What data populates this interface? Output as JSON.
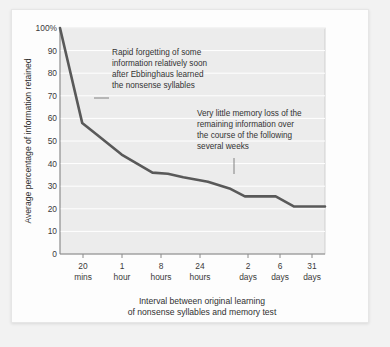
{
  "chart_data": {
    "type": "line",
    "title": "",
    "xlabel": "Interval between original learning of nonsense syllables and memory test",
    "ylabel": "Average percentage of information retained",
    "ylim": [
      0,
      100
    ],
    "grid": true,
    "legend": "none",
    "categories": [
      "20 mins",
      "1 hour",
      "8 hours",
      "24 hours",
      "2 days",
      "6 days",
      "31 days"
    ],
    "x_tick_top": [
      "20",
      "1",
      "8",
      "24",
      "2",
      "6",
      "31"
    ],
    "x_tick_bottom": [
      "mins",
      "hour",
      "hours",
      "hours",
      "days",
      "days",
      "days"
    ],
    "y_ticks": [
      "100%",
      "90",
      "80",
      "70",
      "60",
      "50",
      "40",
      "30",
      "20",
      "10",
      "0"
    ],
    "y_tick_values": [
      100,
      90,
      80,
      70,
      60,
      50,
      40,
      30,
      20,
      10,
      0
    ],
    "series": [
      {
        "name": "Retention",
        "points": [
          {
            "x": 0.0,
            "label": "immediately",
            "y": 100
          },
          {
            "x": 0.72,
            "label": "20 mins",
            "y": 58
          },
          {
            "x": 1.18,
            "label": "",
            "y": 53
          },
          {
            "x": 2.0,
            "label": "1 hour",
            "y": 44
          },
          {
            "x": 3.0,
            "label": "8 hours",
            "y": 36
          },
          {
            "x": 3.5,
            "label": "",
            "y": 35.5
          },
          {
            "x": 4.0,
            "label": "24 hours",
            "y": 34
          },
          {
            "x": 4.8,
            "label": "",
            "y": 32
          },
          {
            "x": 5.5,
            "label": "",
            "y": 29
          },
          {
            "x": 6.0,
            "label": "2 days",
            "y": 25.5
          },
          {
            "x": 6.6,
            "label": "",
            "y": 25.5
          },
          {
            "x": 7.0,
            "label": "6 days",
            "y": 25.5
          },
          {
            "x": 7.6,
            "label": "",
            "y": 21
          },
          {
            "x": 8.6,
            "label": "31 days",
            "y": 21
          }
        ]
      }
    ],
    "annotations": [
      {
        "name": "rapid-forgetting-note",
        "lines": [
          "Rapid forgetting of some",
          "information relatively soon",
          "after Ebbinghaus learned",
          "the nonsense syllables"
        ],
        "leader": "horizontal-left"
      },
      {
        "name": "little-memory-loss-note",
        "lines": [
          "Very little memory loss of the",
          "remaining information over",
          "the course of the following",
          "several weeks"
        ],
        "leader": "vertical-down"
      }
    ],
    "caption_lines": [
      "Interval between original learning",
      "of nonsense syllables and memory test"
    ],
    "colors": {
      "line": "#595959",
      "plot_background": "#ececec",
      "gridline": "#ffffff",
      "axis": "#8a8a8a",
      "text": "#333333",
      "card_background": "#fdfdfd"
    }
  }
}
